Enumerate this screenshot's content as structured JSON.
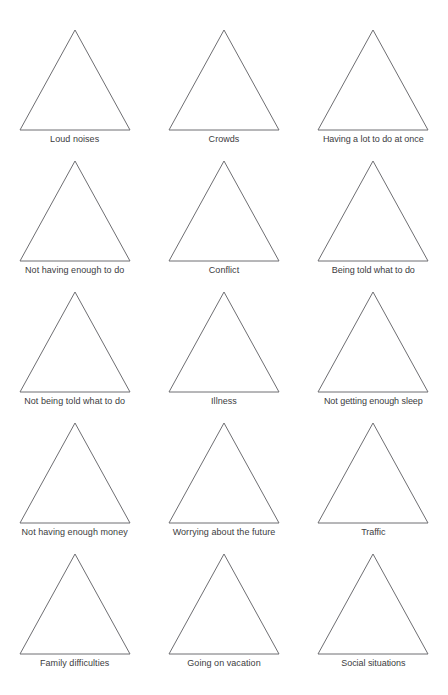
{
  "page": {
    "title_faint": "",
    "background_color": "#ffffff",
    "shape_stroke_color": "#6e6e72",
    "shape_fill_color": "#ffffff",
    "label_color": "#3c3c3e",
    "columns": 3,
    "rows": 5,
    "total_cards": 15
  },
  "shape": {
    "name": "triangle",
    "sides": 3,
    "orientation": "apex-up"
  },
  "cards": [
    {
      "index": 1,
      "row": 1,
      "column": 1,
      "shape": "triangle",
      "label": "Loud noises"
    },
    {
      "index": 2,
      "row": 1,
      "column": 2,
      "shape": "triangle",
      "label": "Crowds"
    },
    {
      "index": 3,
      "row": 1,
      "column": 3,
      "shape": "triangle",
      "label": "Having a lot to do at once"
    },
    {
      "index": 4,
      "row": 2,
      "column": 1,
      "shape": "triangle",
      "label": "Not having enough to do"
    },
    {
      "index": 5,
      "row": 2,
      "column": 2,
      "shape": "triangle",
      "label": "Conflict"
    },
    {
      "index": 6,
      "row": 2,
      "column": 3,
      "shape": "triangle",
      "label": "Being told what to do"
    },
    {
      "index": 7,
      "row": 3,
      "column": 1,
      "shape": "triangle",
      "label": "Not being told what to do"
    },
    {
      "index": 8,
      "row": 3,
      "column": 2,
      "shape": "triangle",
      "label": "Illness"
    },
    {
      "index": 9,
      "row": 3,
      "column": 3,
      "shape": "triangle",
      "label": "Not getting enough sleep"
    },
    {
      "index": 10,
      "row": 4,
      "column": 1,
      "shape": "triangle",
      "label": "Not having enough money"
    },
    {
      "index": 11,
      "row": 4,
      "column": 2,
      "shape": "triangle",
      "label": "Worrying about the future"
    },
    {
      "index": 12,
      "row": 4,
      "column": 3,
      "shape": "triangle",
      "label": "Traffic"
    },
    {
      "index": 13,
      "row": 5,
      "column": 1,
      "shape": "triangle",
      "label": "Family difficulties"
    },
    {
      "index": 14,
      "row": 5,
      "column": 2,
      "shape": "triangle",
      "label": "Going on vacation"
    },
    {
      "index": 15,
      "row": 5,
      "column": 3,
      "shape": "triangle",
      "label": "Social situations"
    }
  ]
}
